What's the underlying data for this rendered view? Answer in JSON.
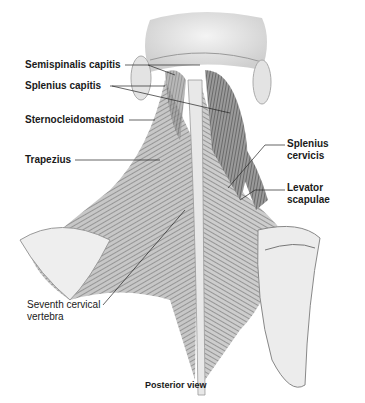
{
  "figure": {
    "view": "Posterior view",
    "labels": [
      {
        "id": "semispinalis-capitis",
        "text": "Semispinalis capitis",
        "bold": true
      },
      {
        "id": "splenius-capitis",
        "text": "Splenius capitis",
        "bold": true
      },
      {
        "id": "sternocleidomastoid",
        "text": "Sternocleidomastoid",
        "bold": true
      },
      {
        "id": "trapezius",
        "text": "Trapezius",
        "bold": true
      },
      {
        "id": "splenius-cervicis-1",
        "text": "Splenius",
        "bold": true
      },
      {
        "id": "splenius-cervicis-2",
        "text": "cervicis",
        "bold": true
      },
      {
        "id": "levator-scapulae-1",
        "text": "Levator",
        "bold": true
      },
      {
        "id": "levator-scapulae-2",
        "text": "scapulae",
        "bold": true
      },
      {
        "id": "seventh-cervical-1",
        "text": "Seventh cervical",
        "bold": false
      },
      {
        "id": "seventh-cervical-2",
        "text": "vertebra",
        "bold": false
      }
    ]
  }
}
